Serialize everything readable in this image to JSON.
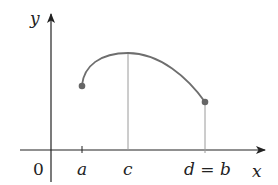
{
  "figure": {
    "type": "function-graph",
    "axes": {
      "x_label": "x",
      "y_label": "y",
      "origin_label": "0"
    },
    "tick_labels": {
      "a": "a",
      "c": "c",
      "d_eq_b": "d = b"
    },
    "curve": {
      "description": "continuous curve on [a, b] with maximum at c and endpoint at d = b",
      "start_point": "a",
      "max_point": "c",
      "end_point": "b"
    },
    "colors": {
      "axis": "#222222",
      "curve": "#6e6e6e",
      "guide_line": "#9a9a9a",
      "point": "#666666"
    }
  }
}
